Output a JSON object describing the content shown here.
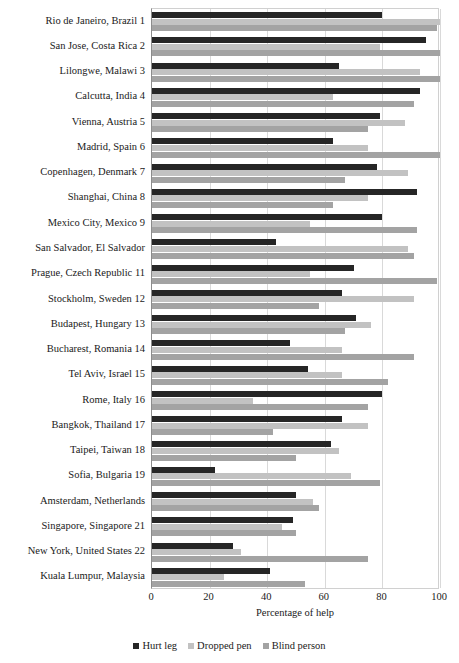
{
  "chart_data": {
    "type": "bar",
    "orientation": "horizontal",
    "title": "",
    "xlabel": "Percentage of help",
    "ylabel": "",
    "xlim": [
      0,
      100
    ],
    "xticks": [
      0,
      20,
      40,
      60,
      80,
      100
    ],
    "grid": true,
    "legend_position": "bottom",
    "categories": [
      "Rio de Janeiro, Brazil 1",
      "San Jose, Costa Rica 2",
      "Lilongwe, Malawi 3",
      "Calcutta, India 4",
      "Vienna, Austria 5",
      "Madrid, Spain 6",
      "Copenhagen, Denmark 7",
      "Shanghai, China 8",
      "Mexico City, Mexico 9",
      "San Salvador, El Salvador",
      "Prague, Czech Republic 11",
      "Stockholm, Sweden 12",
      "Budapest, Hungary 13",
      "Bucharest, Romania 14",
      "Tel Aviv, Israel 15",
      "Rome, Italy 16",
      "Bangkok, Thailand 17",
      "Taipei, Taiwan 18",
      "Sofia, Bulgaria 19",
      "Amsterdam, Netherlands",
      "Singapore, Singapore 21",
      "New York, United States 22",
      "Kuala Lumpur, Malaysia"
    ],
    "series": [
      {
        "name": "Hurt leg",
        "color": "#262626",
        "values": [
          80,
          95,
          65,
          93,
          79,
          63,
          78,
          92,
          80,
          43,
          70,
          66,
          71,
          48,
          54,
          80,
          66,
          62,
          22,
          50,
          49,
          28,
          41
        ]
      },
      {
        "name": "Dropped pen",
        "color": "#c2c2c2",
        "values": [
          100,
          79,
          93,
          63,
          88,
          75,
          89,
          75,
          55,
          89,
          55,
          91,
          76,
          66,
          66,
          35,
          75,
          65,
          69,
          56,
          45,
          31,
          25
        ]
      },
      {
        "name": "Blind person",
        "color": "#a3a3a3",
        "values": [
          99,
          100,
          100,
          91,
          75,
          100,
          67,
          63,
          92,
          91,
          99,
          58,
          67,
          91,
          82,
          75,
          42,
          50,
          79,
          58,
          50,
          75,
          53
        ]
      }
    ]
  },
  "legend": {
    "items": [
      {
        "label": "Hurt leg",
        "color": "#262626"
      },
      {
        "label": "Dropped pen",
        "color": "#c2c2c2"
      },
      {
        "label": "Blind person",
        "color": "#a3a3a3"
      }
    ]
  }
}
